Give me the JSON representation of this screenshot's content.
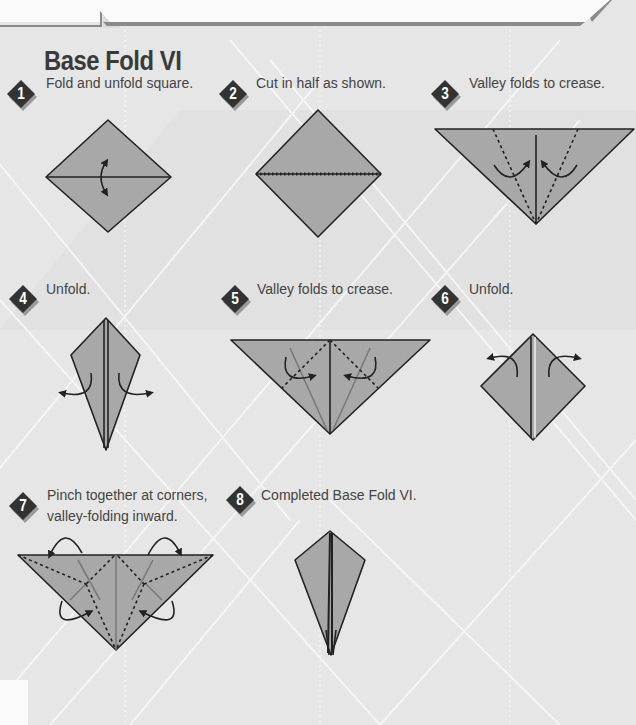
{
  "page": {
    "title": "Base Fold VI",
    "colors": {
      "background": "#e6e6e6",
      "paper": "#a8a8a8",
      "badge": "#3a3a3a",
      "text": "#444444",
      "outline": "#222222"
    }
  },
  "steps": [
    {
      "number": "1",
      "text": "Fold and unfold square."
    },
    {
      "number": "2",
      "text": "Cut in half as shown."
    },
    {
      "number": "3",
      "text": "Valley folds to crease."
    },
    {
      "number": "4",
      "text": "Unfold."
    },
    {
      "number": "5",
      "text": "Valley folds to crease."
    },
    {
      "number": "6",
      "text": "Unfold."
    },
    {
      "number": "7",
      "text": "Pinch together at corners,",
      "text2": "valley-folding inward."
    },
    {
      "number": "8",
      "text": "Completed Base Fold VI."
    }
  ]
}
